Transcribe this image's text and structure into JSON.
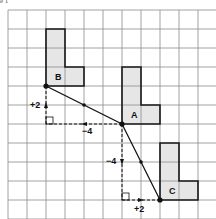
{
  "caption": "e 1",
  "grid": {
    "origin_x": 8,
    "origin_y": 10,
    "cell": 19,
    "cols": 11,
    "rows": 11,
    "line_color": "#8a8a8a"
  },
  "shapes": [
    {
      "label": "B",
      "points": "46,29 65,29 65,67 84,67 84,86 46,86",
      "label_x": 55,
      "label_y": 80
    },
    {
      "label": "A",
      "points": "122,67 141,67 141,105 160,105 160,124 122,124",
      "label_x": 131,
      "label_y": 118
    },
    {
      "label": "C",
      "points": "160,143 179,143 179,181 198,181 198,200 160,200",
      "label_x": 169,
      "label_y": 194
    }
  ],
  "shape_fill": "#e6e6e6",
  "shape_stroke": "#1a1a1a",
  "vectors": {
    "B_to_A": {
      "x1": 46,
      "y1": 86,
      "x2": 122,
      "y2": 124
    },
    "A_to_C": {
      "x1": 122,
      "y1": 124,
      "x2": 160,
      "y2": 200
    }
  },
  "components": [
    {
      "name": "up",
      "label": "+2",
      "x1": 46,
      "y1": 124,
      "x2": 46,
      "y2": 86,
      "label_x": 30,
      "label_y": 108
    },
    {
      "name": "left",
      "label": "−4",
      "x1": 122,
      "y1": 124,
      "x2": 46,
      "y2": 124,
      "label_x": 82,
      "label_y": 134
    },
    {
      "name": "down",
      "label": "−4",
      "x1": 122,
      "y1": 124,
      "x2": 122,
      "y2": 200,
      "label_x": 106,
      "label_y": 164
    },
    {
      "name": "right",
      "label": "+2",
      "x1": 122,
      "y1": 200,
      "x2": 160,
      "y2": 200,
      "label_x": 134,
      "label_y": 212
    }
  ],
  "points": [
    {
      "label": "B",
      "x": 46,
      "y": 86
    },
    {
      "label": "A",
      "x": 122,
      "y": 124
    },
    {
      "label": "C",
      "x": 160,
      "y": 200
    }
  ]
}
